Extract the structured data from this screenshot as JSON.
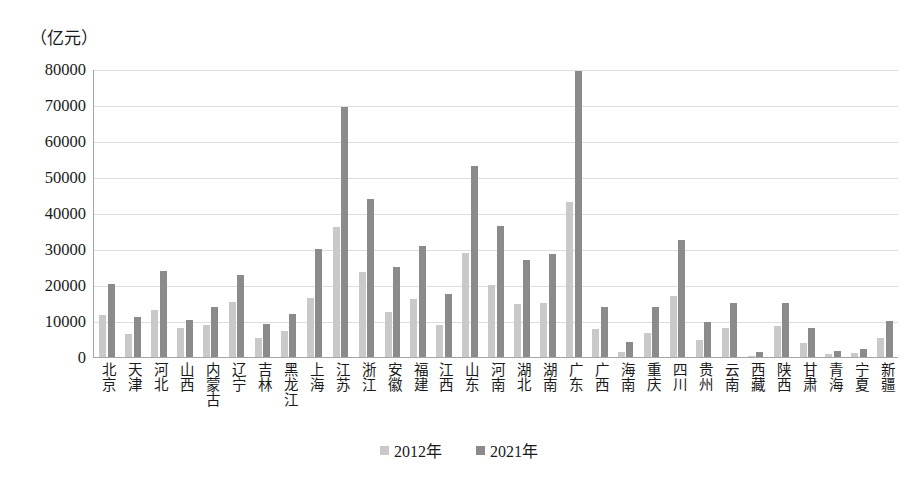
{
  "chart_data": {
    "type": "bar",
    "title": "",
    "subtitle": "",
    "unit_label": "（亿元）",
    "xlabel": "",
    "ylabel": "",
    "ylim": [
      0,
      80000
    ],
    "ytick_step": 10000,
    "yticks": [
      "80000",
      "70000",
      "60000",
      "50000",
      "40000",
      "30000",
      "20000",
      "10000",
      "0"
    ],
    "ytick_values": [
      80000,
      70000,
      60000,
      50000,
      40000,
      30000,
      20000,
      10000,
      0
    ],
    "grid": true,
    "legend_position": "bottom-center",
    "categories": [
      "北京",
      "天津",
      "河北",
      "山西",
      "内蒙古",
      "辽宁",
      "吉林",
      "黑龙江",
      "上海",
      "江苏",
      "浙江",
      "安徽",
      "福建",
      "江西",
      "山东",
      "河南",
      "湖北",
      "湖南",
      "广东",
      "广西",
      "海南",
      "重庆",
      "四川",
      "贵州",
      "云南",
      "西藏",
      "陕西",
      "甘肃",
      "青海",
      "宁夏",
      "新疆"
    ],
    "series": [
      {
        "name": "2012年",
        "color": "#c9c9c9",
        "values": [
          11800,
          6400,
          13200,
          8000,
          8800,
          15300,
          5200,
          7300,
          16500,
          36000,
          23700,
          12400,
          16000,
          8900,
          29000,
          20000,
          14800,
          15000,
          43000,
          7800,
          1500,
          6800,
          17000,
          4800,
          8000,
          300,
          8500,
          3900,
          800,
          1100,
          5400
        ]
      },
      {
        "name": "2021年",
        "color": "#8b8b8b",
        "values": [
          20400,
          11000,
          23900,
          10200,
          14000,
          22800,
          9300,
          12000,
          29900,
          69500,
          44000,
          25000,
          30800,
          17500,
          53000,
          36500,
          27000,
          28500,
          79400,
          13800,
          4300,
          14000,
          32500,
          9800,
          15000,
          1500,
          14900,
          8000,
          1800,
          2200,
          10000
        ]
      }
    ]
  },
  "legend": {
    "items": [
      {
        "label": "2012年",
        "color": "#c9c9c9"
      },
      {
        "label": "2021年",
        "color": "#8b8b8b"
      }
    ]
  },
  "colors": {
    "series_2012": "#c9c9c9",
    "series_2021": "#8b8b8b",
    "gridline": "#dedede",
    "axis": "#a6a6a6",
    "text": "#1a1a1a",
    "background": "#ffffff"
  }
}
